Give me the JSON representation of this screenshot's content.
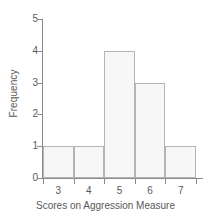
{
  "chart_data": {
    "type": "bar",
    "title": "",
    "xlabel": "Scores on Aggression Measure",
    "ylabel": "Frequency",
    "categories": [
      "3",
      "4",
      "5",
      "6",
      "7"
    ],
    "values": [
      1,
      1,
      4,
      3,
      1
    ],
    "xticks": [
      "3",
      "4",
      "5",
      "6",
      "7"
    ],
    "yticks": [
      "0",
      "1",
      "2",
      "3",
      "4",
      "5"
    ],
    "ylim": [
      0,
      5
    ],
    "grid": false,
    "legend": false,
    "legend_position": "none",
    "bar_fill_color": "#f7f7f7",
    "bar_border_color": "#b4b4b4",
    "axis_color": "#8a8a8a",
    "text_color": "#595959",
    "background_color": "#ffffff"
  }
}
